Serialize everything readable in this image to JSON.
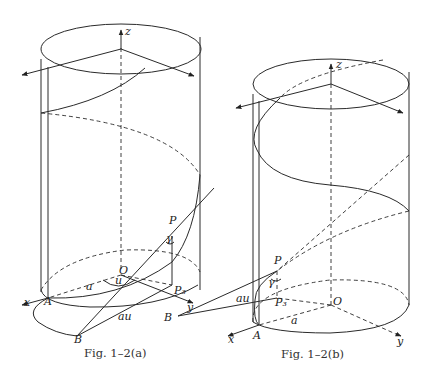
{
  "figures": [
    {
      "id": "a",
      "caption": "Fig. 1–2(a)",
      "labels": {
        "z": "z",
        "x": "x",
        "y": "y",
        "A": "A",
        "B": "B",
        "O": "O",
        "P": "P",
        "P3": "P₃",
        "a": "a",
        "u": "u",
        "au": "au",
        "gamma": "γ"
      }
    },
    {
      "id": "b",
      "caption": "Fig. 1–2(b)",
      "labels": {
        "z": "z",
        "x": "x",
        "y": "y",
        "A": "A",
        "B": "B",
        "O": "O",
        "P": "P",
        "P3": "P₃",
        "a": "a",
        "au": "au",
        "gamma": "γ"
      }
    }
  ]
}
